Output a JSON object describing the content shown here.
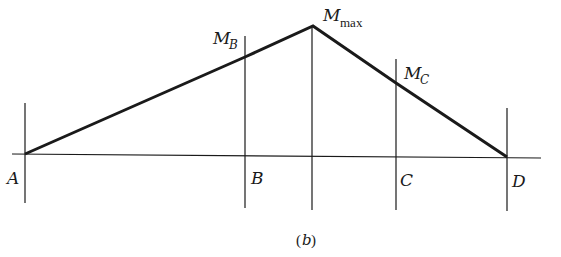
{
  "figure": {
    "caption": "(b)",
    "caption_open": "(",
    "caption_letter": "b",
    "caption_close": ")",
    "stroke_color": "#1a1a1a"
  },
  "points": {
    "A": {
      "label": "A"
    },
    "B": {
      "label": "B"
    },
    "C": {
      "label": "C"
    },
    "D": {
      "label": "D"
    }
  },
  "moments": {
    "M_B": {
      "main": "M",
      "sub": "B"
    },
    "M_max": {
      "main": "M",
      "sub": "max"
    },
    "M_C": {
      "main": "M",
      "sub": "C"
    }
  },
  "geometry": {
    "baseline": {
      "x1": 12,
      "y1": 154,
      "x2": 541,
      "y2": 158
    },
    "verticals": [
      {
        "id": "A",
        "x": 25,
        "y1": 103,
        "y2": 203
      },
      {
        "id": "B",
        "x": 245,
        "y1": 36,
        "y2": 208
      },
      {
        "id": "max",
        "x": 312,
        "y1": 26,
        "y2": 210
      },
      {
        "id": "C",
        "x": 396,
        "y1": 59,
        "y2": 210
      },
      {
        "id": "D",
        "x": 507,
        "y1": 108,
        "y2": 211
      }
    ],
    "moment_diagram": [
      {
        "x": 25,
        "y": 154
      },
      {
        "x": 245,
        "y": 57
      },
      {
        "x": 313,
        "y": 26
      },
      {
        "x": 396,
        "y": 83
      },
      {
        "x": 507,
        "y": 157
      }
    ]
  }
}
